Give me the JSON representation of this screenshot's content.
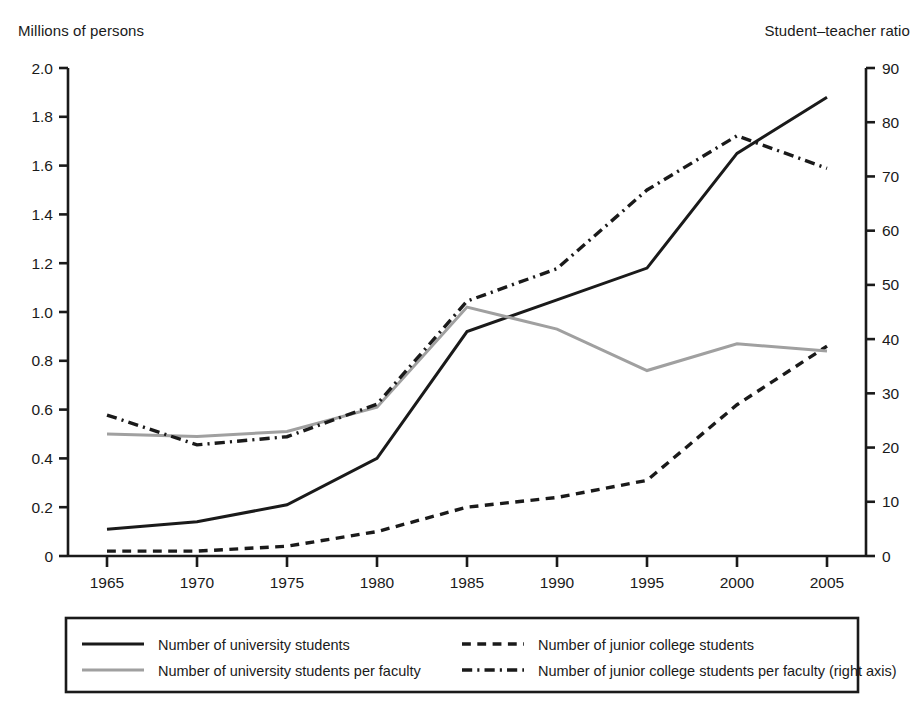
{
  "left_axis": {
    "title": "Millions of persons",
    "ticks": [
      "0",
      "0.2",
      "0.4",
      "0.6",
      "0.8",
      "1.0",
      "1.2",
      "1.4",
      "1.6",
      "1.8",
      "2.0"
    ]
  },
  "right_axis": {
    "title": "Student–teacher ratio",
    "ticks": [
      "0",
      "10",
      "20",
      "30",
      "40",
      "50",
      "60",
      "70",
      "80",
      "90"
    ]
  },
  "legend": {
    "items": [
      {
        "label": "Number of university students",
        "style": "solid",
        "color": "#1a1a1a"
      },
      {
        "label": "Number of junior college students",
        "style": "dashed",
        "color": "#1a1a1a"
      },
      {
        "label": "Number of university students per faculty",
        "style": "solid",
        "color": "#a0a0a0"
      },
      {
        "label": "Number of junior college students per faculty (right axis)",
        "style": "dash-dot",
        "color": "#1a1a1a"
      }
    ]
  },
  "chart_data": {
    "type": "line",
    "title": "",
    "xlabel": "",
    "ylabel": "Millions of persons",
    "y2label": "Student–teacher ratio",
    "grid": false,
    "legend_position": "bottom",
    "x": [
      1965,
      1970,
      1975,
      1980,
      1985,
      1990,
      1995,
      2000,
      2005
    ],
    "xticklabels": [
      "1965",
      "1970",
      "1975",
      "1980",
      "1985",
      "1990",
      "1995",
      "2000",
      "2005"
    ],
    "ylim": [
      0,
      2.0
    ],
    "y2lim": [
      0,
      90
    ],
    "yticks": [
      0,
      0.2,
      0.4,
      0.6,
      0.8,
      1.0,
      1.2,
      1.4,
      1.6,
      1.8,
      2.0
    ],
    "y2ticks": [
      0,
      10,
      20,
      30,
      40,
      50,
      60,
      70,
      80,
      90
    ],
    "series": [
      {
        "name": "Number of university students",
        "axis": "left",
        "style": "solid",
        "color": "#1a1a1a",
        "width": 3.0,
        "values": [
          0.11,
          0.14,
          0.21,
          0.4,
          0.92,
          1.05,
          1.18,
          1.65,
          1.88
        ]
      },
      {
        "name": "Number of junior college students",
        "axis": "left",
        "style": "dashed",
        "color": "#1a1a1a",
        "width": 3.4,
        "values": [
          0.02,
          0.02,
          0.04,
          0.1,
          0.2,
          0.24,
          0.31,
          0.62,
          0.86
        ]
      },
      {
        "name": "Number of university students per faculty",
        "axis": "left",
        "style": "solid",
        "color": "#a0a0a0",
        "width": 3.0,
        "values": [
          0.5,
          0.49,
          0.51,
          0.61,
          1.02,
          0.93,
          0.76,
          0.87,
          0.84
        ]
      },
      {
        "name": "Number of junior college students per faculty (right axis)",
        "axis": "right",
        "style": "dash-dot",
        "color": "#1a1a1a",
        "width": 3.4,
        "values": [
          26.0,
          20.5,
          22.0,
          28.0,
          47.0,
          53.0,
          67.5,
          77.5,
          71.5
        ]
      }
    ]
  }
}
